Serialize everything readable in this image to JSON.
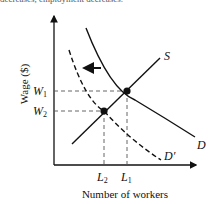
{
  "caption": "decreases, employment decreases.",
  "diagram": {
    "type": "labor-market-supply-demand",
    "y_axis_label": "Wage ($)",
    "x_axis_label": "Number of workers",
    "curves": {
      "supply": "S",
      "demand": "D",
      "new_demand": "D′"
    },
    "wage_labels": {
      "w1_main": "W",
      "w1_sub": "1",
      "w2_main": "W",
      "w2_sub": "2"
    },
    "quantity_labels": {
      "l1_main": "L",
      "l1_sub": "1",
      "l2_main": "L",
      "l2_sub": "2"
    },
    "shift_direction": "left",
    "colors": {
      "line": "#111111",
      "guide": "#555555"
    }
  }
}
